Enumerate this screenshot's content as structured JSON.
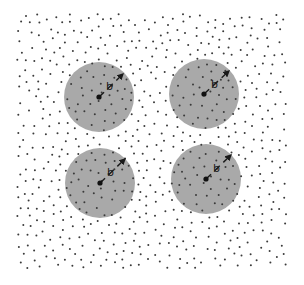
{
  "figure": {
    "width": 304,
    "height": 285,
    "background": "#ffffff",
    "point_field": {
      "x_min": 17,
      "x_max": 286,
      "y_min": 14,
      "y_max": 268,
      "count": 720,
      "dot_radius": 1.0,
      "dot_color": "#3a3a3a",
      "min_spacing": 7.2,
      "seed": 12345
    },
    "circles": [
      {
        "id": "top-left",
        "cx": 99,
        "cy": 97,
        "r": 35,
        "label": "b",
        "label_x": 106,
        "label_y": 90,
        "arrow_to_x": 123,
        "arrow_to_y": 74
      },
      {
        "id": "top-right",
        "cx": 204,
        "cy": 94,
        "r": 35,
        "label": "b",
        "label_x": 211,
        "label_y": 88,
        "arrow_to_x": 229,
        "arrow_to_y": 71
      },
      {
        "id": "bottom-left",
        "cx": 100,
        "cy": 183,
        "r": 35,
        "label": "b",
        "label_x": 107,
        "label_y": 176,
        "arrow_to_x": 125,
        "arrow_to_y": 159
      },
      {
        "id": "bottom-right",
        "cx": 206,
        "cy": 179,
        "r": 35,
        "label": "b",
        "label_x": 213,
        "label_y": 172,
        "arrow_to_x": 231,
        "arrow_to_y": 155
      }
    ],
    "circle_fill": "#a9a9a9",
    "center_dot_radius": 2.6,
    "center_dot_color": "#111111",
    "arrow_color": "#1a1a1a",
    "radius_symbol": "b"
  }
}
